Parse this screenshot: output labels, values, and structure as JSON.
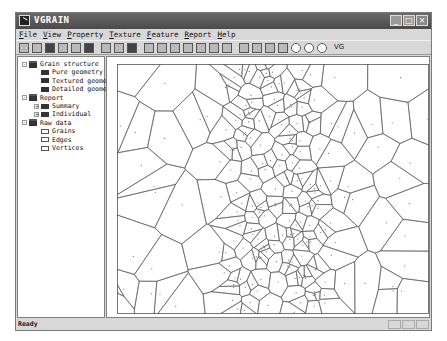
{
  "window": {
    "title": "VGRAIN",
    "buttons": [
      "_",
      "□",
      "×"
    ]
  },
  "menu": [
    "File",
    "View",
    "Property",
    "Texture",
    "Feature",
    "Report",
    "Help"
  ],
  "toolbar": {
    "groups": [
      [
        "select-icon",
        "window-icon",
        "grid-icon",
        "image-icon",
        "open-icon",
        "save-icon"
      ],
      [
        "copy-icon",
        "paste-icon",
        "print-icon"
      ],
      [
        "measure-icon",
        "measure2-icon",
        "table-icon",
        "angle-icon",
        "angle2-icon",
        "zoom-icon",
        "zoom-fit-icon"
      ],
      [
        "columns-icon",
        "columns2-icon",
        "columns3-icon",
        "histogram-icon",
        "target-icon",
        "target2-icon",
        "target3-icon"
      ]
    ],
    "extra_label": "VG"
  },
  "tree": [
    {
      "label": "Grain structure",
      "level": 0,
      "expander": "-",
      "icon": "folder"
    },
    {
      "label": "Pure geometry",
      "level": 1,
      "icon": "solid"
    },
    {
      "label": "Textured geometry",
      "level": 1,
      "icon": "solid"
    },
    {
      "label": "Detailed geometry",
      "level": 1,
      "icon": "solid"
    },
    {
      "label": "Report",
      "level": 0,
      "expander": "-",
      "icon": "folder"
    },
    {
      "label": "Summary",
      "level": 1,
      "expander": "+",
      "icon": "solid"
    },
    {
      "label": "Individual",
      "level": 1,
      "expander": "+",
      "icon": "solid"
    },
    {
      "label": "Raw data",
      "level": 0,
      "expander": "-",
      "icon": "folder"
    },
    {
      "label": "Grains",
      "level": 1,
      "icon": "hollow"
    },
    {
      "label": "Edges",
      "level": 1,
      "icon": "hollow"
    },
    {
      "label": "Vertices",
      "level": 1,
      "icon": "hollow"
    }
  ],
  "status": {
    "text": "Ready"
  },
  "canvas": {
    "width": 312,
    "height": 250,
    "stroke": "#555555",
    "seed": 7,
    "coarse_points": 70,
    "fine_points": 150,
    "fine_band": [
      0.36,
      0.66
    ]
  }
}
